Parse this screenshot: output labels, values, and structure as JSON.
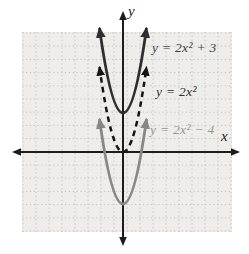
{
  "figure": {
    "x_axis_label": "x",
    "y_axis_label": "y"
  },
  "colors": {
    "background": "#ffffff",
    "grid_background": "#eeedea",
    "gridline": "#c2c2c2",
    "axis": "#1c1c1c"
  },
  "chart_data": {
    "type": "line",
    "title": "",
    "xlabel": "x",
    "ylabel": "y",
    "grid": true,
    "legend_position": "labels-on-plot",
    "axes": {
      "x_range": [
        -7.5,
        8
      ],
      "y_range": [
        -6,
        10.5
      ],
      "units_per_gridline": 1
    },
    "series": [
      {
        "name": "y = 2x² + 3",
        "equation": "y = 2x^2 + 3",
        "coefficient_a": 2,
        "vertical_shift": 3,
        "vertex": [
          0,
          3
        ],
        "style": "solid",
        "color": "#2f2f2f",
        "label_color": "#3e3e3e",
        "points": [
          [
            -1.5,
            7.5
          ],
          [
            -1,
            5
          ],
          [
            -0.5,
            3.5
          ],
          [
            0,
            3
          ],
          [
            0.5,
            3.5
          ],
          [
            1,
            5
          ],
          [
            1.5,
            7.5
          ]
        ]
      },
      {
        "name": "y = 2x²",
        "equation": "y = 2x^2",
        "coefficient_a": 2,
        "vertical_shift": 0,
        "vertex": [
          0,
          0
        ],
        "style": "dashed",
        "color": "#151515",
        "label_color": "#2d2d2d",
        "points": [
          [
            -1.5,
            4.5
          ],
          [
            -1,
            2
          ],
          [
            -0.5,
            0.5
          ],
          [
            0,
            0
          ],
          [
            0.5,
            0.5
          ],
          [
            1,
            2
          ],
          [
            1.5,
            4.5
          ]
        ]
      },
      {
        "name": "y = 2x² − 4",
        "equation": "y = 2x^2 - 4",
        "coefficient_a": 2,
        "vertical_shift": -4,
        "vertex": [
          0,
          -4
        ],
        "style": "solid",
        "color": "#878787",
        "label_color": "#979797",
        "points": [
          [
            -1.5,
            0.5
          ],
          [
            -1,
            -2
          ],
          [
            -0.5,
            -3.5
          ],
          [
            0,
            -4
          ],
          [
            0.5,
            -3.5
          ],
          [
            1,
            -2
          ],
          [
            1.5,
            0.5
          ]
        ]
      }
    ]
  }
}
